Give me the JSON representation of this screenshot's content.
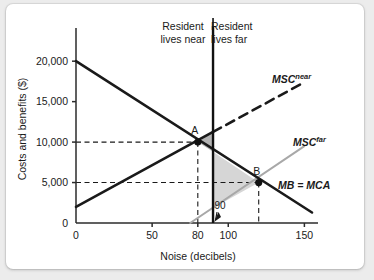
{
  "chart_data": {
    "type": "line",
    "title": "",
    "xlabel": "Noise (decibels)",
    "ylabel": "Costs and benefits ($)",
    "xlim": [
      0,
      155
    ],
    "ylim": [
      0,
      22000
    ],
    "xticks": [
      {
        "value": 0,
        "label": "0"
      },
      {
        "value": 50,
        "label": "50"
      },
      {
        "value": 80,
        "label": "80"
      },
      {
        "value": 100,
        "label": "100"
      },
      {
        "value": 150,
        "label": "150"
      }
    ],
    "yticks": [
      {
        "value": 0,
        "label": "0"
      },
      {
        "value": 5000,
        "label": "5,000"
      },
      {
        "value": 10000,
        "label": "10,000"
      },
      {
        "value": 15000,
        "label": "15,000"
      },
      {
        "value": 20000,
        "label": "20,000"
      }
    ],
    "grid": false,
    "legend_position": "inline-curve-labels",
    "series": [
      {
        "name": "MB = MCA",
        "label": "MB = MCA",
        "style": "solid",
        "color": "#1a1a1a",
        "width": 2.6,
        "points": [
          [
            0,
            20000
          ],
          [
            155,
            1300
          ]
        ]
      },
      {
        "name": "MSC near",
        "label": "MSC",
        "superscript": "near",
        "style": "solid-then-dashed",
        "color": "#1a1a1a",
        "width": 2.6,
        "solid_points": [
          [
            0,
            2000
          ],
          [
            90,
            11250
          ]
        ],
        "dashed_points": [
          [
            90,
            11250
          ],
          [
            150,
            17400
          ]
        ]
      },
      {
        "name": "MSC far",
        "label": "MSC",
        "superscript": "far",
        "style": "solid",
        "color": "#a8a8a8",
        "width": 2.0,
        "points": [
          [
            75,
            0
          ],
          [
            150,
            9500
          ]
        ]
      }
    ],
    "points_of_interest": [
      {
        "label": "A",
        "x": 80,
        "y": 10000
      },
      {
        "label": "B",
        "x": 120,
        "y": 5000
      }
    ],
    "dashed_guides": [
      {
        "from": [
          0,
          10000
        ],
        "to": [
          80,
          10000
        ]
      },
      {
        "from": [
          80,
          10000
        ],
        "to": [
          80,
          0
        ]
      },
      {
        "from": [
          0,
          5000
        ],
        "to": [
          120,
          5000
        ]
      },
      {
        "from": [
          120,
          5000
        ],
        "to": [
          120,
          0
        ]
      }
    ],
    "vertical_divider": {
      "x": 90,
      "label": "90"
    },
    "shaded_regions": [
      {
        "name": "deadweight-loss-near",
        "color": "#b4b4b4",
        "vertices": [
          [
            80,
            10000
          ],
          [
            90,
            11250
          ],
          [
            90,
            8800
          ]
        ]
      },
      {
        "name": "deadweight-loss-far",
        "color": "#d6d6d6",
        "vertices": [
          [
            90,
            8800
          ],
          [
            90,
            1850
          ],
          [
            120,
            5000
          ]
        ]
      }
    ],
    "region_labels": [
      {
        "id": "near",
        "line1": "Resident",
        "line2": "lives near"
      },
      {
        "id": "far",
        "line1": "Resident",
        "line2": "lives far"
      }
    ],
    "annotations": [
      {
        "id": "divider-callout",
        "text": "90",
        "points_to_x": 90
      }
    ]
  }
}
